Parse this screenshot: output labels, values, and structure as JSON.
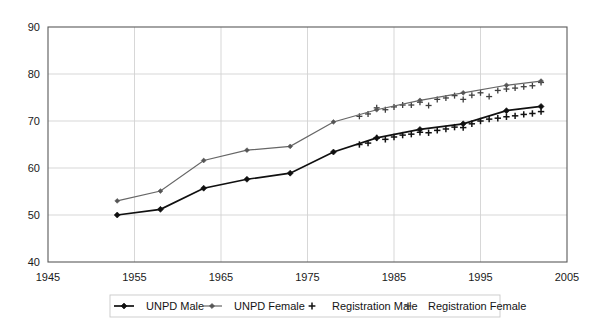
{
  "chart_data": {
    "type": "line",
    "title": "",
    "subtitle": "",
    "xlabel": "",
    "ylabel": "",
    "xlim": [
      1945,
      2005
    ],
    "ylim": [
      40,
      90
    ],
    "xticks": [
      1945,
      1955,
      1965,
      1975,
      1985,
      1995,
      2005
    ],
    "yticks": [
      40,
      50,
      60,
      70,
      80,
      90
    ],
    "xtick_labels": [
      "1945",
      "1955",
      "1965",
      "1975",
      "1985",
      "1995",
      "2005"
    ],
    "ytick_labels": [
      "40",
      "50",
      "60",
      "70",
      "80",
      "90"
    ],
    "grid": true,
    "legend_position": "bottom",
    "series": [
      {
        "name": "UNPD Male",
        "marker": "diamond",
        "color": "#101010",
        "style": "line-marker",
        "x": [
          1953,
          1958,
          1963,
          1968,
          1973,
          1978,
          1983,
          1988,
          1993,
          1998,
          2002
        ],
        "y": [
          50.0,
          51.2,
          55.7,
          57.6,
          58.9,
          63.4,
          66.4,
          68.2,
          69.4,
          72.2,
          73.1
        ]
      },
      {
        "name": "UNPD Female",
        "marker": "diamond",
        "color": "#666666",
        "style": "line-marker",
        "x": [
          1953,
          1958,
          1963,
          1968,
          1973,
          1978,
          1983,
          1988,
          1993,
          1998,
          2002
        ],
        "y": [
          53.0,
          55.1,
          61.6,
          63.8,
          64.6,
          69.8,
          72.4,
          74.4,
          76.0,
          77.6,
          78.5
        ]
      },
      {
        "name": "Registration Male",
        "marker": "plus",
        "color": "#111111",
        "style": "marker-only",
        "x": [
          1981,
          1982,
          1983,
          1984,
          1985,
          1986,
          1987,
          1988,
          1989,
          1990,
          1991,
          1992,
          1993,
          1994,
          1995,
          1996,
          1997,
          1998,
          1999,
          2000,
          2001,
          2002
        ],
        "y": [
          65.0,
          65.3,
          66.4,
          66.1,
          66.6,
          67.0,
          67.2,
          67.6,
          67.5,
          68.0,
          68.3,
          68.7,
          68.6,
          69.4,
          70.0,
          70.4,
          70.6,
          70.9,
          71.1,
          71.4,
          71.6,
          72.0
        ]
      },
      {
        "name": "Registration Female",
        "marker": "plus",
        "color": "#3f3f3f",
        "style": "marker-only",
        "x": [
          1981,
          1982,
          1983,
          1984,
          1985,
          1986,
          1987,
          1988,
          1989,
          1990,
          1991,
          1992,
          1993,
          1994,
          1995,
          1996,
          1997,
          1998,
          1999,
          2000,
          2001,
          2002
        ],
        "y": [
          71.0,
          71.5,
          72.8,
          72.4,
          73.0,
          73.4,
          73.4,
          74.0,
          73.3,
          74.6,
          74.9,
          75.4,
          74.6,
          75.5,
          76.0,
          75.2,
          76.5,
          76.8,
          77.0,
          77.3,
          77.5,
          78.2
        ]
      }
    ]
  },
  "legend": {
    "items": [
      {
        "label": "UNPD Male",
        "marker": "diamond-line",
        "color": "#101010"
      },
      {
        "label": "UNPD Female",
        "marker": "diamond-line",
        "color": "#666666"
      },
      {
        "label": "Registration Male",
        "marker": "plus",
        "color": "#111111"
      },
      {
        "label": "Registration Female",
        "marker": "plus",
        "color": "#3f3f3f"
      }
    ]
  }
}
